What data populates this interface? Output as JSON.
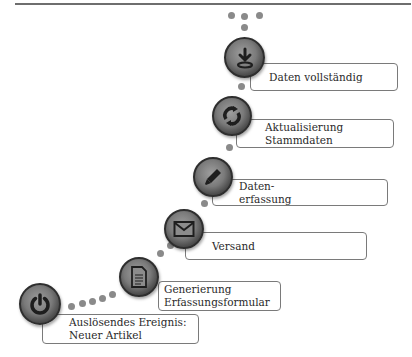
{
  "diagram": {
    "title": "",
    "steps": [
      {
        "id": 1,
        "icon": "power-icon",
        "label": "Auslösendes Ereignis:\nNeuer Artikel"
      },
      {
        "id": 2,
        "icon": "document-icon",
        "label": "Generierung\nErfassungsformular"
      },
      {
        "id": 3,
        "icon": "mail-icon",
        "label": "Versand"
      },
      {
        "id": 4,
        "icon": "pencil-icon",
        "label": "Daten-\nerfassung"
      },
      {
        "id": 5,
        "icon": "refresh-icon",
        "label": "Aktualisierung\nStammdaten"
      },
      {
        "id": 6,
        "icon": "download-icon",
        "label": "Daten vollständig"
      }
    ],
    "continuation": "...",
    "colors": {
      "circle": "#6e6e6e",
      "dots": "#8a8a8a",
      "box_border": "#7a7a7a",
      "text": "#2a2a2a"
    }
  }
}
